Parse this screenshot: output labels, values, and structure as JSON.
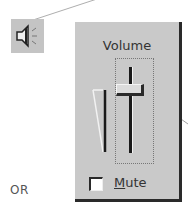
{
  "tray_icon": {
    "name": "speaker-icon"
  },
  "volume_panel": {
    "title": "Volume",
    "slider": {
      "position_percent": 80
    },
    "mute": {
      "label_underlined": "M",
      "label_rest": "ute",
      "checked": false
    }
  },
  "caption": {
    "or_label": "OR"
  },
  "colors": {
    "panel_bg": "#c9c9c9",
    "shadow": "#2a2a2a",
    "icon_bg": "#c4c4c4"
  }
}
